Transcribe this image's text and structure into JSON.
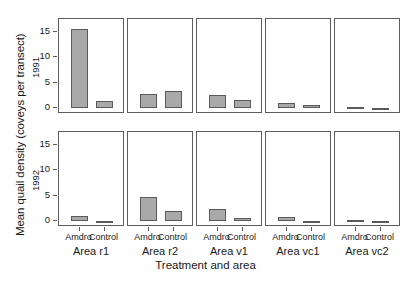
{
  "chart_data": {
    "type": "bar",
    "title": "",
    "xlabel": "Treatment and area",
    "ylabel": "Mean quail density (coveys per transect)",
    "ylim": [
      -1.2,
      17.5
    ],
    "yticks": [
      0,
      5,
      10,
      15
    ],
    "ytick_labels": [
      "0",
      "5",
      "10",
      "15"
    ],
    "grid": false,
    "legend": "none",
    "layout": "trellis 2 rows x 5 columns",
    "row_labels": [
      "1991",
      "1992"
    ],
    "categories": [
      "Amdro",
      "Control"
    ],
    "panels": [
      "Area r1",
      "Area r2",
      "Area v1",
      "Area vc1",
      "Area vc2"
    ],
    "rows": [
      {
        "row_label": "1991",
        "panels": [
          {
            "name": "Area r1",
            "categories": [
              "Amdro",
              "Control"
            ],
            "values": [
              15.5,
              1.3
            ]
          },
          {
            "name": "Area r2",
            "categories": [
              "Amdro",
              "Control"
            ],
            "values": [
              2.8,
              3.4
            ]
          },
          {
            "name": "Area v1",
            "categories": [
              "Amdro",
              "Control"
            ],
            "values": [
              2.5,
              1.6
            ]
          },
          {
            "name": "Area vc1",
            "categories": [
              "Amdro",
              "Control"
            ],
            "values": [
              1.0,
              0.5
            ]
          },
          {
            "name": "Area vc2",
            "categories": [
              "Amdro",
              "Control"
            ],
            "values": [
              0.2,
              0.0
            ]
          }
        ]
      },
      {
        "row_label": "1992",
        "panels": [
          {
            "name": "Area r1",
            "categories": [
              "Amdro",
              "Control"
            ],
            "values": [
              0.9,
              0.0
            ]
          },
          {
            "name": "Area r2",
            "categories": [
              "Amdro",
              "Control"
            ],
            "values": [
              4.7,
              2.0
            ]
          },
          {
            "name": "Area v1",
            "categories": [
              "Amdro",
              "Control"
            ],
            "values": [
              2.3,
              0.6
            ]
          },
          {
            "name": "Area vc1",
            "categories": [
              "Amdro",
              "Control"
            ],
            "values": [
              0.7,
              0.0
            ]
          },
          {
            "name": "Area vc2",
            "categories": [
              "Amdro",
              "Control"
            ],
            "values": [
              0.2,
              0.0
            ]
          }
        ]
      }
    ],
    "colors": {
      "bar_fill": "#a9a9a9",
      "bar_border": "#5a5a5a",
      "panel_border": "#5d5d5d",
      "text": "#1a1a1a",
      "background": "#ffffff"
    }
  }
}
